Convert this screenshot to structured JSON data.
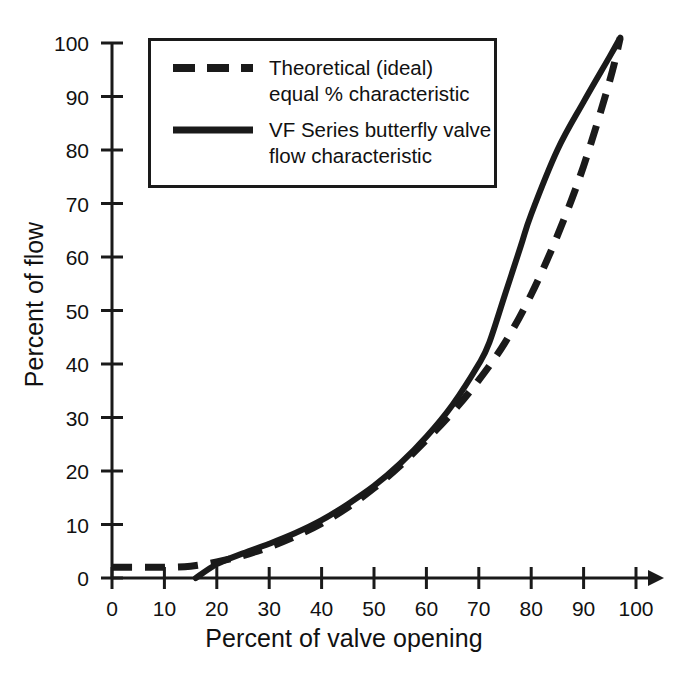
{
  "chart_data": {
    "type": "line",
    "title": "",
    "xlabel": "Percent of valve opening",
    "ylabel": "Percent of flow",
    "xlim": [
      0,
      100
    ],
    "ylim": [
      0,
      100
    ],
    "grid": false,
    "legend_position": "top-left-inside",
    "xticks": [
      0,
      10,
      20,
      30,
      40,
      50,
      60,
      70,
      80,
      90,
      100
    ],
    "yticks": [
      0,
      10,
      20,
      30,
      40,
      50,
      60,
      70,
      80,
      90,
      100
    ],
    "xtick_labels": [
      "0",
      "10",
      "20",
      "30",
      "40",
      "50",
      "60",
      "70",
      "80",
      "90",
      "100"
    ],
    "ytick_labels": [
      "0",
      "10",
      "20",
      "30",
      "40",
      "50",
      "60",
      "70",
      "80",
      "90",
      "100"
    ],
    "x_axis_arrow": true,
    "series": [
      {
        "name": "Theoretical (ideal)\nequal % characteristic",
        "style": "dashed",
        "color": "#1a1a1a",
        "x": [
          0,
          5,
          10,
          15,
          20,
          25,
          30,
          35,
          40,
          45,
          50,
          55,
          60,
          65,
          70,
          75,
          80,
          85,
          90,
          95,
          97
        ],
        "y": [
          2,
          2,
          2,
          2.2,
          3,
          4.2,
          5.8,
          7.8,
          10.2,
          13.2,
          16.8,
          21,
          25.8,
          31,
          37,
          44,
          53,
          64,
          77,
          93,
          101
        ]
      },
      {
        "name": "VF Series butterfly valve\nflow characteristic",
        "style": "solid",
        "color": "#1a1a1a",
        "x": [
          16,
          20,
          25,
          30,
          35,
          40,
          45,
          50,
          55,
          60,
          65,
          70,
          72,
          75,
          78,
          80,
          85,
          90,
          95,
          97
        ],
        "y": [
          0,
          2.6,
          4.6,
          6.4,
          8.4,
          10.8,
          13.8,
          17.2,
          21.4,
          26.4,
          32.4,
          40,
          44,
          53,
          62,
          68,
          80,
          89,
          97.5,
          101
        ]
      }
    ]
  },
  "legend": {
    "entries": [
      {
        "label": "Theoretical (ideal)\nequal % characteristic",
        "style": "dashed"
      },
      {
        "label": "VF Series butterfly valve\nflow characteristic",
        "style": "solid"
      }
    ]
  },
  "axes": {
    "x_title": "Percent of valve opening",
    "y_title": "Percent of flow"
  }
}
